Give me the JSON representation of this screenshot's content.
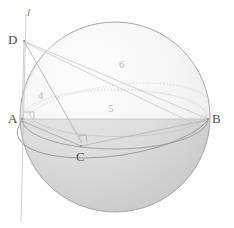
{
  "figure": {
    "canvas": {
      "width": 234,
      "height": 228,
      "background": "#ffffff"
    },
    "sphere": {
      "name": "sphere",
      "center_x": 115,
      "center_y": 117,
      "radius": 95,
      "outline_color": "#9a9a9a",
      "upper_fill": "#f4f4f4",
      "lower_fill": "#d8d8d8"
    },
    "points": [
      {
        "id": "A",
        "label": "A",
        "x": 22,
        "y": 119,
        "label_x": 8,
        "label_y": 112
      },
      {
        "id": "B",
        "label": "B",
        "x": 208,
        "y": 119,
        "label_x": 212,
        "label_y": 112
      },
      {
        "id": "C",
        "label": "C",
        "x": 81,
        "y": 146,
        "label_x": 76,
        "label_y": 150
      },
      {
        "id": "D",
        "label": "D",
        "x": 24,
        "y": 41,
        "label_x": 10,
        "label_y": 33
      }
    ],
    "line_label": {
      "text": "l",
      "x": 27,
      "y": 9
    },
    "numbers": [
      {
        "text": "4",
        "x": 38,
        "y": 90
      },
      {
        "text": "5",
        "x": 108,
        "y": 103
      },
      {
        "text": "6",
        "x": 119,
        "y": 59
      }
    ],
    "colors": {
      "point_text": "#4a4a4a",
      "number_text": "#b9b9b9",
      "line_text": "#7d7d7d",
      "chord_stroke": "#b0b0b0",
      "faint_stroke": "#cfcfcf",
      "equator_stroke": "#9c9c9c",
      "axis_stroke": "#c4c4c4"
    },
    "right_angles": [
      {
        "at": "A",
        "x": 24,
        "y": 112
      },
      {
        "at": "C",
        "x": 82,
        "y": 136
      }
    ]
  }
}
